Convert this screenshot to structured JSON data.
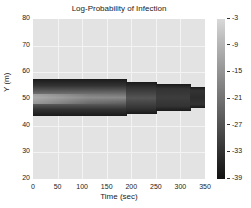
{
  "chart_data": {
    "type": "heatmap",
    "title": "Log-Probability of Infection",
    "xlabel": "Time (sec)",
    "ylabel": "Y (m)",
    "xlim": [
      0,
      350
    ],
    "ylim": [
      20,
      80
    ],
    "xticks": [
      0,
      50,
      100,
      150,
      200,
      250,
      300,
      350
    ],
    "yticks": [
      20,
      30,
      40,
      50,
      60,
      70,
      80
    ],
    "grid": true,
    "colorbar": {
      "ticks": [
        -3,
        -9,
        -15,
        -21,
        -27,
        -33,
        -39
      ],
      "range": [
        -39,
        -3
      ],
      "colormap": "gray"
    },
    "background_value": -3,
    "band_segments": [
      {
        "t_start": 0,
        "t_end": 190,
        "y_min": 43.5,
        "y_max": 57.5
      },
      {
        "t_start": 190,
        "t_end": 250,
        "y_min": 44.5,
        "y_max": 56.5
      },
      {
        "t_start": 250,
        "t_end": 320,
        "y_min": 45.5,
        "y_max": 55.5
      },
      {
        "t_start": 320,
        "t_end": 350,
        "y_min": 46.5,
        "y_max": 54.5
      }
    ],
    "band_description": "Low log-probability region (dark, ~-39 at edges) centered near Y=50, lighter interior (~-20) near Y=50 at early times, darkening with time"
  }
}
